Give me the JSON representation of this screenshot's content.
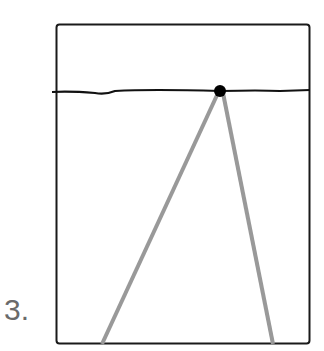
{
  "figure": {
    "label": "3.",
    "colors": {
      "frame": "#1a1a1a",
      "horizon": "#111111",
      "rays": "#999999",
      "dot": "#000000"
    },
    "frame": {
      "x": 56,
      "y": 24,
      "w": 254,
      "h": 320
    },
    "horizon": {
      "y": 91
    },
    "vanishing_point": {
      "x": 220,
      "y": 91
    },
    "rays": [
      {
        "x2": 102,
        "y2": 344
      },
      {
        "x2": 273,
        "y2": 344
      }
    ]
  }
}
